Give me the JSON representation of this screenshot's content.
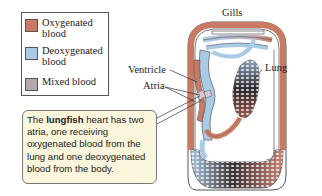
{
  "legend": {
    "items": [
      {
        "label_line1": "Oxygenated",
        "label_line2": "blood",
        "color": "#c97a63"
      },
      {
        "label_line1": "Deoxygenated",
        "label_line2": "blood",
        "color": "#a9cbe6"
      },
      {
        "label_line1": "Mixed blood",
        "label_line2": "",
        "color": "#b7a6ad"
      }
    ]
  },
  "labels": {
    "gills": "Gills",
    "ventricle": "Ventricle",
    "atria": "Atria",
    "lung": "Lung"
  },
  "callout": {
    "prefix": "The ",
    "bold": "lungfish",
    "suffix": " heart has two atria, one receiving oxygenated blood from the lung and one deoxygenated blood from the body."
  },
  "colors": {
    "oxygenated": "#c97a63",
    "deoxygenated": "#a9cbe6",
    "mixed": "#b7a6ad",
    "callout_bg": "#fbf6dc"
  }
}
